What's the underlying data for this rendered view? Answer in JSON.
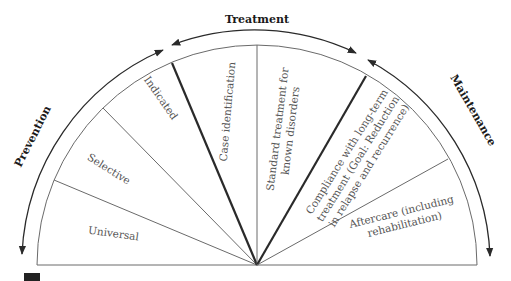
{
  "diagram": {
    "type": "semicircular continuum diagram",
    "phases": [
      {
        "id": "prevention",
        "label": "Prevention"
      },
      {
        "id": "treatment",
        "label": "Treatment"
      },
      {
        "id": "maintenance",
        "label": "Maintenance"
      }
    ],
    "segments": [
      {
        "id": "universal",
        "phase": "prevention",
        "label": "Universal"
      },
      {
        "id": "selective",
        "phase": "prevention",
        "label": "Selective"
      },
      {
        "id": "indicated",
        "phase": "prevention",
        "label": "Indicated"
      },
      {
        "id": "case-identification",
        "phase": "treatment",
        "label": "Case identification"
      },
      {
        "id": "standard-treatment",
        "phase": "treatment",
        "label_lines": [
          "Standard treatment for",
          "known disorders"
        ]
      },
      {
        "id": "compliance",
        "phase": "maintenance",
        "label_lines": [
          "Compliance with long-term",
          "treatment (Goal: Reduction",
          "in relapse and recurrence)"
        ]
      },
      {
        "id": "aftercare",
        "phase": "maintenance",
        "label_lines": [
          "Aftercare (including",
          "rehabilitation)"
        ]
      }
    ],
    "colors": {
      "thin_line": "#6a6a6a",
      "thick_line": "#2a2a2a",
      "label_text": "#555555",
      "phase_text": "#1a1a1a",
      "corner_marker": "#222222"
    }
  }
}
